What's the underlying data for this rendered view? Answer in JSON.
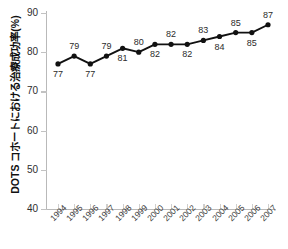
{
  "chart_data": {
    "type": "line",
    "title": "",
    "xlabel": "",
    "ylabel": "DOTS コホートにおける治療成功率(%)",
    "ylim": [
      40,
      90
    ],
    "yticks": [
      40,
      50,
      60,
      70,
      80,
      90
    ],
    "grid": false,
    "legend": "none",
    "marker": "filled-circle",
    "line_color": "#111111",
    "categories": [
      "1994",
      "1995",
      "1996",
      "1997",
      "1998",
      "1999",
      "2000",
      "2001",
      "2002",
      "2003",
      "2004",
      "2005",
      "2006",
      "2007"
    ],
    "values": [
      77,
      79,
      77,
      79,
      81,
      80,
      82,
      82,
      82,
      83,
      84,
      85,
      85,
      87
    ],
    "point_label_positions": [
      "below",
      "above",
      "below",
      "above",
      "below",
      "above",
      "below",
      "above",
      "below",
      "above",
      "below",
      "above",
      "below",
      "above"
    ],
    "series": [
      {
        "name": "DOTS cohort treatment success rate",
        "values": [
          77,
          79,
          77,
          79,
          81,
          80,
          82,
          82,
          82,
          83,
          84,
          85,
          85,
          87
        ]
      }
    ]
  },
  "axis": {
    "y_title": "DOTS コホートにおける治療成功率(%)",
    "y_tick_labels": [
      "90",
      "80",
      "70",
      "60",
      "50",
      "40"
    ],
    "x_tick_labels": [
      "1994",
      "1995",
      "1996",
      "1997",
      "1998",
      "1999",
      "2000",
      "2001",
      "2002",
      "2003",
      "2004",
      "2005",
      "2006",
      "2007"
    ]
  }
}
